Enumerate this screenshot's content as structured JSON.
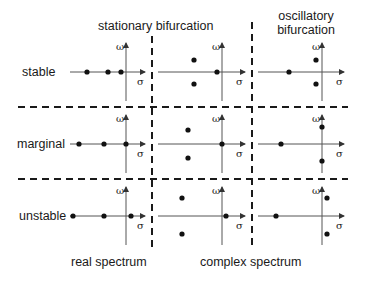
{
  "labels": {
    "col_stationary": "stationary bifurcation",
    "col_oscillatory_1": "oscillatory",
    "col_oscillatory_2": "bifurcation",
    "row_stable": "stable",
    "row_marginal": "marginal",
    "row_unstable": "unstable",
    "bottom_real": "real spectrum",
    "bottom_complex": "complex spectrum",
    "axis_omega": "ω",
    "axis_sigma": "σ"
  },
  "panels": [
    {
      "row": "stable",
      "col": 1,
      "dots": [
        [
          87,
          72
        ],
        [
          108,
          72
        ],
        [
          121,
          72
        ]
      ]
    },
    {
      "row": "stable",
      "col": 2,
      "dots": [
        [
          194,
          60
        ],
        [
          194,
          84
        ],
        [
          217,
          72
        ]
      ]
    },
    {
      "row": "stable",
      "col": 3,
      "dots": [
        [
          289,
          72
        ],
        [
          316,
          60
        ],
        [
          316,
          84
        ]
      ]
    },
    {
      "row": "marginal",
      "col": 1,
      "dots": [
        [
          79,
          144
        ],
        [
          104,
          144
        ],
        [
          126,
          144
        ]
      ]
    },
    {
      "row": "marginal",
      "col": 2,
      "dots": [
        [
          188,
          130
        ],
        [
          188,
          158
        ],
        [
          222,
          144
        ]
      ]
    },
    {
      "row": "marginal",
      "col": 3,
      "dots": [
        [
          281,
          144
        ],
        [
          322,
          127
        ],
        [
          322,
          161
        ]
      ]
    },
    {
      "row": "unstable",
      "col": 1,
      "dots": [
        [
          73,
          216
        ],
        [
          104,
          216
        ],
        [
          131,
          216
        ]
      ]
    },
    {
      "row": "unstable",
      "col": 2,
      "dots": [
        [
          182,
          198
        ],
        [
          182,
          234
        ],
        [
          226,
          216
        ]
      ]
    },
    {
      "row": "unstable",
      "col": 3,
      "dots": [
        [
          276,
          216
        ],
        [
          327,
          198
        ],
        [
          327,
          234
        ]
      ]
    }
  ]
}
